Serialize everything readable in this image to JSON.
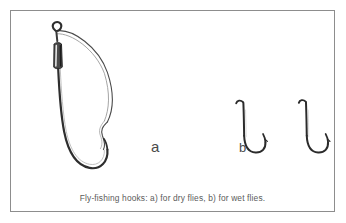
{
  "figure": {
    "caption": "Fly-fishing hooks: a) for dry flies, b) for wet flies.",
    "frame_color": "#8d8d8d",
    "background_color": "#ffffff",
    "ink_color": "#333333",
    "labels": [
      {
        "key": "a",
        "text": "a",
        "describes": "large weedless hook for dry flies"
      },
      {
        "key": "b",
        "text": "b",
        "describes": "two small hooks for wet flies"
      }
    ],
    "items": [
      {
        "id": "hook-a",
        "label": "a",
        "name": "large-weedless-hook",
        "parts": [
          "eye",
          "tapered-sleeve",
          "shank",
          "bend",
          "point",
          "weed-guard-wire"
        ]
      },
      {
        "id": "hook-b-1",
        "label": "b",
        "name": "small-wet-fly-hook",
        "parts": [
          "turned-down-eye",
          "shank",
          "bend",
          "point",
          "barb"
        ]
      },
      {
        "id": "hook-b-2",
        "label": "b",
        "name": "small-wet-fly-hook",
        "parts": [
          "turned-down-eye",
          "shank",
          "bend",
          "point",
          "barb"
        ]
      }
    ]
  }
}
